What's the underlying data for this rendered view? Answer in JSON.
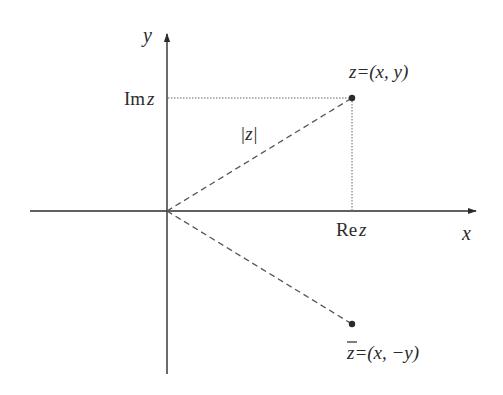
{
  "diagram": {
    "type": "complex-plane",
    "axes": {
      "x_label": "x",
      "y_label": "y"
    },
    "labels": {
      "im_z_prefix": "Im",
      "im_z_var": "z",
      "re_z_prefix": "Re",
      "re_z_var": "z",
      "modulus": "|z|",
      "point_z": "z=(x, y)",
      "point_z_var": "z",
      "point_z_rest": "=(x, y)",
      "point_conj_var": "z",
      "point_conj_rest": "=(x, −y)"
    },
    "points": [
      {
        "name": "z",
        "coords": "(x, y)"
      },
      {
        "name": "z-conjugate",
        "coords": "(x, -y)"
      }
    ],
    "colors": {
      "ink": "#2b2b2b",
      "dashed": "#555555",
      "dotted": "#666666"
    }
  }
}
